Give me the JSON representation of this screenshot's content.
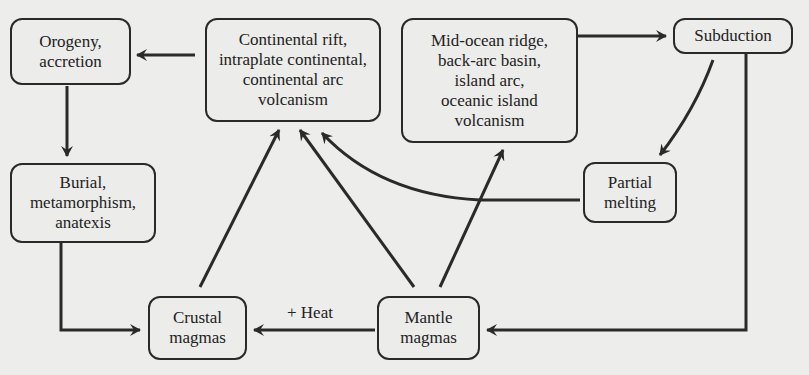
{
  "nodes": {
    "orogeny": "Orogeny,\naccretion",
    "continental": "Continental rift,\nintraplate continental,\ncontinental arc\nvolcanism",
    "midocean": "Mid-ocean ridge,\nback-arc basin,\nisland arc,\noceanic island\nvolcanism",
    "subduction": "Subduction",
    "partial_melting": "Partial\nmelting",
    "burial": "Burial,\nmetamorphism,\nanatexis",
    "crustal_magmas": "Crustal\nmagmas",
    "mantle_magmas": "Mantle\nmagmas"
  },
  "edge_labels": {
    "heat": "+ Heat"
  },
  "colors": {
    "background": "#ededeb",
    "stroke": "#2a2a2a"
  }
}
